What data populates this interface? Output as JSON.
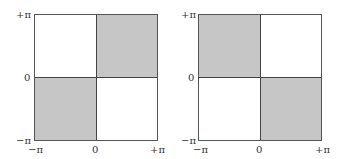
{
  "colors": {
    "shaded": "#c6c6c6",
    "unshaded": "#ffffff",
    "border": "#555555"
  },
  "panels": [
    {
      "id": "left",
      "y_axis": {
        "top": "+π",
        "middle": "0",
        "bottom": "−π"
      },
      "x_axis": {
        "left": "−π",
        "middle": "0",
        "right": "+π"
      },
      "quadrants": {
        "top_left": "unshaded",
        "top_right": "shaded",
        "bottom_left": "shaded",
        "bottom_right": "unshaded"
      }
    },
    {
      "id": "right",
      "y_axis": {
        "top": "+π",
        "middle": "0",
        "bottom": "−π"
      },
      "x_axis": {
        "left": "−π",
        "middle": "0",
        "right": "+π"
      },
      "quadrants": {
        "top_left": "shaded",
        "top_right": "unshaded",
        "bottom_left": "unshaded",
        "bottom_right": "shaded"
      }
    }
  ]
}
